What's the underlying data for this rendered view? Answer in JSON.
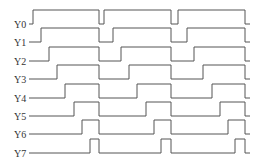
{
  "diagram": {
    "type": "timing-diagram",
    "line_color": "#555555",
    "label_color": "#333333",
    "x_start": 29,
    "x_end": 250,
    "pulse_height": 14,
    "signals": [
      {
        "label": "Y0",
        "baseline": 24,
        "pulses": [
          [
            33,
            99
          ],
          [
            104,
            171
          ],
          [
            178,
            245
          ]
        ]
      },
      {
        "label": "Y1",
        "baseline": 42,
        "pulses": [
          [
            41,
            99
          ],
          [
            113,
            171
          ],
          [
            187,
            245
          ]
        ]
      },
      {
        "label": "Y2",
        "baseline": 61,
        "pulses": [
          [
            49,
            99
          ],
          [
            121,
            171
          ],
          [
            194,
            245
          ]
        ]
      },
      {
        "label": "Y3",
        "baseline": 79,
        "pulses": [
          [
            57,
            99
          ],
          [
            129,
            171
          ],
          [
            203,
            245
          ]
        ]
      },
      {
        "label": "Y4",
        "baseline": 98,
        "pulses": [
          [
            65,
            99
          ],
          [
            137,
            171
          ],
          [
            212,
            245
          ]
        ]
      },
      {
        "label": "Y5",
        "baseline": 116,
        "pulses": [
          [
            74,
            99
          ],
          [
            146,
            171
          ],
          [
            220,
            245
          ]
        ]
      },
      {
        "label": "Y6",
        "baseline": 134,
        "pulses": [
          [
            82,
            99
          ],
          [
            154,
            171
          ],
          [
            228,
            245
          ]
        ]
      },
      {
        "label": "Y7",
        "baseline": 153,
        "pulses": [
          [
            90,
            99
          ],
          [
            161,
            171
          ],
          [
            235,
            245
          ]
        ]
      }
    ]
  }
}
